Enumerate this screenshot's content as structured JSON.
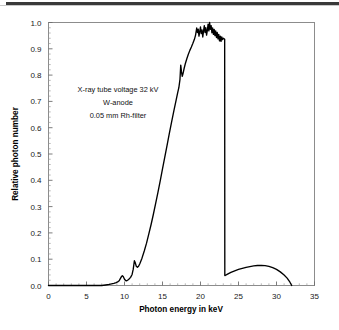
{
  "figure": {
    "background_color": "#ffffff",
    "line_color": "#000000",
    "axis_color": "#8c8c8c",
    "annotation_lines": [
      "X-ray tube voltage 32 kV",
      "W-anode",
      "0.05 mm Rh-filter"
    ]
  },
  "chart_data": {
    "type": "line",
    "title": "",
    "subtitle": "",
    "xlabel": "Photon energy  in keV",
    "ylabel": "Relative photon number",
    "xlim": [
      0,
      35
    ],
    "ylim": [
      0.0,
      1.0
    ],
    "xticks": [
      0,
      5,
      10,
      15,
      20,
      25,
      30,
      35
    ],
    "xtick_labels": [
      "0",
      "5",
      "10",
      "15",
      "20",
      "25",
      "30",
      "35"
    ],
    "yticks": [
      0.0,
      0.1,
      0.2,
      0.3,
      0.4,
      0.5,
      0.6,
      0.7,
      0.8,
      0.9,
      1.0
    ],
    "ytick_labels": [
      "0.0",
      "0.1",
      "0.2",
      "0.3",
      "0.4",
      "0.5",
      "0.6",
      "0.7",
      "0.8",
      "0.9",
      "1.0"
    ],
    "x_minor_tick_step": 1,
    "y_minor_tick_step": 0.02,
    "grid": false,
    "legend": null,
    "annotations": [
      {
        "text": "X-ray tube voltage 32 kV",
        "x": 8.0,
        "y": 0.72
      },
      {
        "text": "W-anode",
        "x": 8.0,
        "y": 0.665
      },
      {
        "text": "0.05 mm Rh-filter",
        "x": 8.0,
        "y": 0.61
      }
    ],
    "series": [
      {
        "name": "Rh-filtered W-anode spectrum at 32 kV",
        "x": [
          0.0,
          1.0,
          2.0,
          3.0,
          4.0,
          5.0,
          6.0,
          7.0,
          7.5,
          8.0,
          8.3,
          8.6,
          8.9,
          9.1,
          9.3,
          9.45,
          9.6,
          9.72,
          9.85,
          10.0,
          10.15,
          10.3,
          10.45,
          10.6,
          10.8,
          11.0,
          11.15,
          11.3,
          11.42,
          11.55,
          11.7,
          11.85,
          12.0,
          12.3,
          12.6,
          12.9,
          13.2,
          13.5,
          13.8,
          14.1,
          14.4,
          14.7,
          15.0,
          15.3,
          15.6,
          15.9,
          16.2,
          16.5,
          16.8,
          17.0,
          17.15,
          17.3,
          17.4,
          17.5,
          17.6,
          17.7,
          17.85,
          18.0,
          18.2,
          18.4,
          18.6,
          18.8,
          19.0,
          19.2,
          19.35,
          19.5,
          19.6,
          19.7,
          19.8,
          19.9,
          20.0,
          20.1,
          20.2,
          20.3,
          20.4,
          20.5,
          20.6,
          20.7,
          20.8,
          20.9,
          21.0,
          21.1,
          21.2,
          21.3,
          21.4,
          21.5,
          21.6,
          21.7,
          21.8,
          21.9,
          22.0,
          22.1,
          22.2,
          22.3,
          22.4,
          22.5,
          22.6,
          22.7,
          22.8,
          22.9,
          23.0,
          23.1,
          23.18,
          23.2,
          23.25,
          23.5,
          24.0,
          24.5,
          25.0,
          25.5,
          26.0,
          26.5,
          27.0,
          27.5,
          28.0,
          28.5,
          29.0,
          29.5,
          30.0,
          30.5,
          31.0,
          31.4,
          31.7,
          32.0
        ],
        "y": [
          0.0,
          0.0,
          0.0,
          0.0,
          0.0,
          0.0,
          0.0,
          0.0,
          0.002,
          0.004,
          0.006,
          0.008,
          0.011,
          0.014,
          0.018,
          0.026,
          0.034,
          0.037,
          0.033,
          0.024,
          0.019,
          0.018,
          0.021,
          0.025,
          0.031,
          0.042,
          0.062,
          0.094,
          0.086,
          0.073,
          0.069,
          0.073,
          0.082,
          0.104,
          0.131,
          0.161,
          0.196,
          0.232,
          0.271,
          0.312,
          0.354,
          0.398,
          0.443,
          0.488,
          0.533,
          0.578,
          0.622,
          0.665,
          0.706,
          0.733,
          0.752,
          0.784,
          0.838,
          0.812,
          0.795,
          0.806,
          0.826,
          0.843,
          0.862,
          0.879,
          0.894,
          0.907,
          0.921,
          0.936,
          0.952,
          0.979,
          0.962,
          0.975,
          0.948,
          0.965,
          0.983,
          0.958,
          0.972,
          0.945,
          0.967,
          0.988,
          0.962,
          0.98,
          0.952,
          0.97,
          0.994,
          0.968,
          1.0,
          0.974,
          0.988,
          0.961,
          0.979,
          0.955,
          0.974,
          0.95,
          0.968,
          0.943,
          0.962,
          0.938,
          0.955,
          0.93,
          0.948,
          0.928,
          0.945,
          0.935,
          0.94,
          0.938,
          0.936,
          0.038,
          0.038,
          0.042,
          0.05,
          0.056,
          0.061,
          0.065,
          0.069,
          0.072,
          0.0745,
          0.0762,
          0.0768,
          0.0757,
          0.0726,
          0.0678,
          0.0612,
          0.0518,
          0.0398,
          0.028,
          0.016,
          0.0
        ],
        "key_features": {
          "L_alpha_peak_keV": 9.72,
          "L_alpha_peak_value": 0.037,
          "L_beta_peak_keV": 11.3,
          "L_beta_peak_value": 0.094,
          "notch_keV": 17.4,
          "notch_peak_value": 0.838,
          "plateau_range_keV": [
            19.5,
            23.2
          ],
          "plateau_value_range": [
            0.93,
            1.0
          ],
          "rh_k_edge_keV": 23.2,
          "rh_k_edge_drop_to": 0.038,
          "secondary_hump_keV": 28.5,
          "secondary_hump_value": 0.0768,
          "endpoint_keV": 32.0
        }
      }
    ]
  }
}
